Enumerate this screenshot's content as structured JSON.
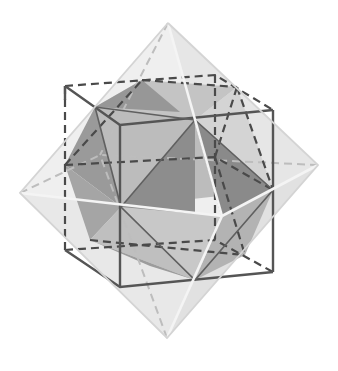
{
  "diagram": {
    "title": "",
    "colors": {
      "background": "#ffffff",
      "cube_edge": "#555555",
      "octahedron_edge": "#dcdcdc",
      "octahedron_face_light": "#e9e9e9",
      "octahedron_face_mid": "#d6d6d6",
      "cubocta_face_dark": "#8f8f8f",
      "cubocta_face_mid": "#bdbdbd",
      "cubocta_face_light": "#cfcfcf",
      "hidden_edge": "#5a5a5a"
    },
    "shapes": [
      {
        "name": "cube",
        "style": "solid dark edges, hidden edges dashed"
      },
      {
        "name": "octahedron",
        "style": "light translucent faces, white edges"
      },
      {
        "name": "cuboctahedron",
        "style": "shaded triangular and square faces"
      }
    ]
  }
}
